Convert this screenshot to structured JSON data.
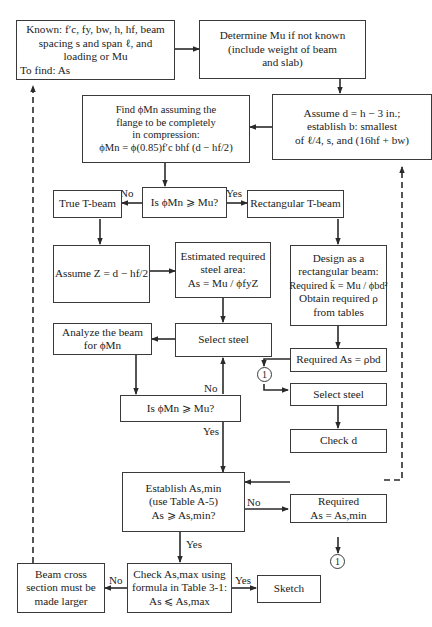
{
  "boxes": {
    "known": {
      "lines": [
        "Known: f′c, fy, bw, h, hf, beam",
        "spacing  s and span ℓ, and",
        "loading or Mu",
        "To find:  As"
      ]
    },
    "determine_mu": {
      "lines": [
        "Determine Mu if not known",
        "(include weight of beam",
        "and slab)"
      ]
    },
    "find_phi_mn": {
      "lines": [
        "Find ϕMn assuming the",
        "flange to be completely",
        "in compression:",
        "ϕMn = ϕ(0.85)f′c bhf (d − hf/2)"
      ]
    },
    "assume_d": {
      "lines": [
        "Assume  d = h − 3 in.;",
        "establish b: smallest",
        "of ℓ/4, s, and (16hf + bw)"
      ]
    },
    "decision_1": {
      "lines": [
        "Is ϕMn ⩾ Mu?"
      ]
    },
    "true_tbeam": {
      "lines": [
        "True T-beam"
      ]
    },
    "rect_tbeam": {
      "lines": [
        "Rectangular  T-beam"
      ]
    },
    "assume_z": {
      "lines": [
        "Assume Z = d − hf/2"
      ]
    },
    "est_steel": {
      "lines": [
        "Estimated required",
        "steel area:",
        "As = Mu / ϕfyZ"
      ]
    },
    "design_rect": {
      "lines": [
        "Design as a",
        "rectangular beam:",
        "Required k̄ = Mu / ϕbd²",
        "Obtain required ρ",
        "from tables"
      ]
    },
    "analyze_beam": {
      "lines": [
        "Analyze the beam",
        "for ϕMn"
      ]
    },
    "select_steel_1": {
      "lines": [
        "Select steel"
      ]
    },
    "required_as": {
      "lines": [
        "Required As = ρbd"
      ]
    },
    "decision_2": {
      "lines": [
        "Is ϕMn ⩾ Mu?"
      ]
    },
    "select_steel_2": {
      "lines": [
        "Select steel"
      ]
    },
    "check_d": {
      "lines": [
        "Check  d"
      ]
    },
    "establish_asmin": {
      "lines": [
        "Establish As,min",
        "(use  Table A-5)",
        "As ⩾ As,min?"
      ]
    },
    "required_asmin": {
      "lines": [
        "Required",
        "As = As,min"
      ]
    },
    "check_asmax": {
      "lines": [
        "Check  As,max using",
        "formula in Table 3-1:",
        "As ⩽ As,max"
      ]
    },
    "beam_larger": {
      "lines": [
        "Beam cross",
        "section must be",
        "made larger"
      ]
    },
    "sketch": {
      "lines": [
        "Sketch"
      ]
    }
  },
  "labels": {
    "d1_no": "No",
    "d1_yes": "Yes",
    "d2_no": "No",
    "d2_yes": "Yes",
    "asmin_no": "No",
    "asmin_yes": "Yes",
    "asmax_no": "No",
    "asmax_yes": "Yes"
  },
  "connectors": {
    "c1_top": "1",
    "c1_bottom": "1"
  }
}
